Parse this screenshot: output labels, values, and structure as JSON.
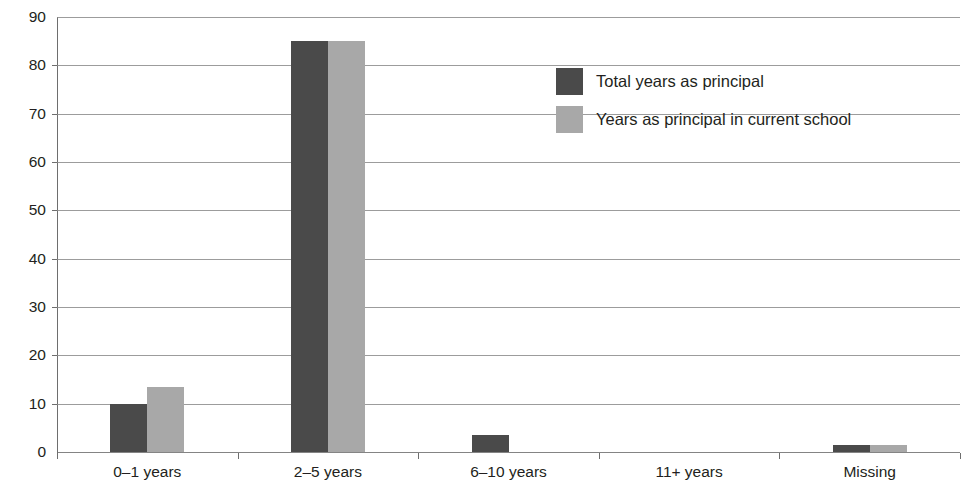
{
  "chart_data": {
    "type": "bar",
    "title": "",
    "xlabel": "",
    "ylabel": "",
    "categories": [
      "0–1 years",
      "2–5 years",
      "6–10 years",
      "11+ years",
      "Missing"
    ],
    "series": [
      {
        "name": "Total years as principal",
        "color": "#4a4a4a",
        "values": [
          10,
          85,
          3.5,
          0,
          1.5
        ]
      },
      {
        "name": "Years as principal in current school",
        "color": "#a8a8a8",
        "values": [
          13.5,
          85,
          0,
          0,
          1.5
        ]
      }
    ],
    "ylim": [
      0,
      90
    ],
    "yticks": [
      0,
      10,
      20,
      30,
      40,
      50,
      60,
      70,
      80,
      90
    ],
    "ytick_labels": [
      "0",
      "10",
      "20",
      "30",
      "40",
      "50",
      "60",
      "70",
      "80",
      "90"
    ],
    "grid": true,
    "legend_position": "upper-center-right",
    "legend_entries": [
      "Total years as principal",
      "Years as principal in current school"
    ]
  },
  "colors": {
    "series_dark": "#4a4a4a",
    "series_light": "#a8a8a8",
    "axis": "#6e6e6e",
    "gridline": "#8b8b8b",
    "text": "#231f20",
    "background": "#ffffff"
  }
}
